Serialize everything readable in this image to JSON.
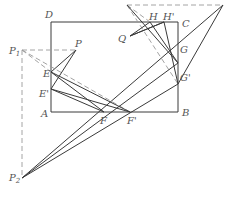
{
  "diagram": {
    "type": "geometry-reflection-construction",
    "colors": {
      "line": "#3a3a3a",
      "dashed": "#9a9a9a",
      "label": "#555555",
      "background": "#ffffff"
    },
    "points": {
      "A": {
        "label": "A",
        "x": 51,
        "y": 112
      },
      "B": {
        "label": "B",
        "x": 178,
        "y": 112
      },
      "C": {
        "label": "C",
        "x": 178,
        "y": 22
      },
      "D": {
        "label": "D",
        "x": 51,
        "y": 22
      },
      "P": {
        "label": "P",
        "x": 76,
        "y": 50
      },
      "P1": {
        "label": "P",
        "sub": "1",
        "x": 22,
        "y": 50
      },
      "P2": {
        "label": "P",
        "sub": "2",
        "x": 22,
        "y": 178
      },
      "Q": {
        "label": "Q",
        "x": 130,
        "y": 36
      },
      "E": {
        "label": "E",
        "x": 51,
        "y": 72
      },
      "E_prime": {
        "label": "E'",
        "x": 51,
        "y": 89
      },
      "F": {
        "label": "F",
        "x": 104,
        "y": 112
      },
      "F_prime": {
        "label": "F'",
        "x": 130,
        "y": 112
      },
      "G": {
        "label": "G",
        "x": 178,
        "y": 63
      },
      "G_prime": {
        "label": "G'",
        "x": 178,
        "y": 84
      },
      "H": {
        "label": "H",
        "x": 150,
        "y": 22
      },
      "H_prime": {
        "label": "H'",
        "x": 164,
        "y": 22
      },
      "Q1": {
        "x": 127,
        "y": 5
      },
      "Q2": {
        "x": 223,
        "y": 5
      }
    },
    "labels": [
      "A",
      "B",
      "C",
      "D",
      "P",
      "P1",
      "P2",
      "Q",
      "E",
      "E'",
      "F",
      "F'",
      "G",
      "G'",
      "H",
      "H'"
    ]
  }
}
